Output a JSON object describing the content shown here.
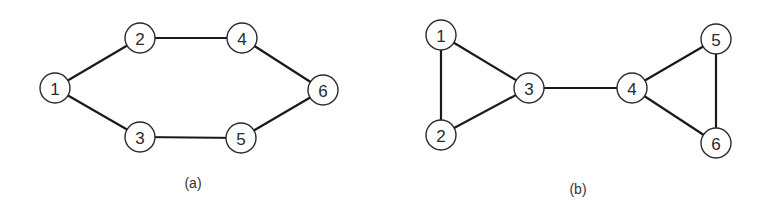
{
  "figures": [
    {
      "id": "a",
      "caption": "(a)",
      "caption_pos": [
        193,
        183
      ],
      "nodes": [
        {
          "id": "1",
          "label": "1",
          "x": 55,
          "y": 88
        },
        {
          "id": "2",
          "label": "2",
          "x": 140,
          "y": 38
        },
        {
          "id": "3",
          "label": "3",
          "x": 140,
          "y": 137
        },
        {
          "id": "4",
          "label": "4",
          "x": 242,
          "y": 38
        },
        {
          "id": "5",
          "label": "5",
          "x": 241,
          "y": 138
        },
        {
          "id": "6",
          "label": "6",
          "x": 323,
          "y": 90
        }
      ],
      "edges": [
        [
          "1",
          "2"
        ],
        [
          "2",
          "4"
        ],
        [
          "4",
          "6"
        ],
        [
          "1",
          "3"
        ],
        [
          "3",
          "5"
        ],
        [
          "5",
          "6"
        ]
      ]
    },
    {
      "id": "b",
      "caption": "(b)",
      "caption_pos": [
        578,
        189
      ],
      "nodes": [
        {
          "id": "1",
          "label": "1",
          "x": 441,
          "y": 35
        },
        {
          "id": "2",
          "label": "2",
          "x": 441,
          "y": 135
        },
        {
          "id": "3",
          "label": "3",
          "x": 529,
          "y": 88
        },
        {
          "id": "4",
          "label": "4",
          "x": 632,
          "y": 88
        },
        {
          "id": "5",
          "label": "5",
          "x": 716,
          "y": 39
        },
        {
          "id": "6",
          "label": "6",
          "x": 716,
          "y": 143
        }
      ],
      "edges": [
        [
          "1",
          "2"
        ],
        [
          "1",
          "3"
        ],
        [
          "2",
          "3"
        ],
        [
          "3",
          "4"
        ],
        [
          "4",
          "5"
        ],
        [
          "4",
          "6"
        ],
        [
          "5",
          "6"
        ]
      ]
    }
  ],
  "style": {
    "node_radius": 15,
    "edge_color": "#1a1a1a",
    "node_stroke": "#2a2a2a",
    "background": "#ffffff"
  }
}
